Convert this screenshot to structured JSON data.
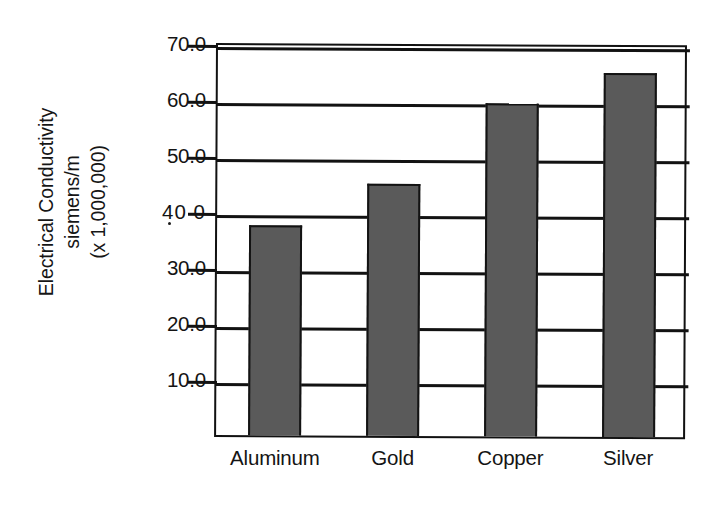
{
  "chart_data": {
    "type": "bar",
    "title": "",
    "subtitle": "",
    "xlabel": "",
    "ylabel": "Electrical Conductivity siemens/m (x 1,000,000)",
    "ylabel_lines": [
      "Electrical Conductivity",
      "siemens/m",
      "(x 1,000,000)"
    ],
    "categories": [
      "Aluminum",
      "Gold",
      "Copper",
      "Silver"
    ],
    "values": [
      37.5,
      45.0,
      59.5,
      65.0
    ],
    "ylim": [
      0,
      70
    ],
    "ytick_values": [
      10.0,
      20.0,
      30.0,
      40.0,
      50.0,
      60.0,
      70.0
    ],
    "ytick_labels": [
      "10.0",
      "20.0",
      "30.0",
      "40 0",
      "50.0",
      "60.0",
      "70.0"
    ],
    "grid": "horizontal",
    "legend": "none",
    "bar_color": "#5a5a5a",
    "bar_edge_color": "#131313",
    "axis_color": "#111111",
    "background_color": "#ffffff"
  },
  "axes": {
    "y_title_line_1": "Electrical Conductivity",
    "y_title_line_2": "siemens/m",
    "y_title_line_3": "(x 1,000,000)"
  },
  "ticks": {
    "y": [
      {
        "label": "70.0",
        "value": 70.0
      },
      {
        "label": "60.0",
        "value": 60.0
      },
      {
        "label": "50.0",
        "value": 50.0
      },
      {
        "label": "40 0",
        "value": 40.0
      },
      {
        "label": "30.0",
        "value": 30.0
      },
      {
        "label": "20.0",
        "value": 20.0
      },
      {
        "label": "10.0",
        "value": 10.0
      }
    ],
    "x": [
      "Aluminum",
      "Gold",
      "Copper",
      "Silver"
    ]
  },
  "bars": [
    {
      "category": "Aluminum",
      "value": 37.5
    },
    {
      "category": "Gold",
      "value": 45.0
    },
    {
      "category": "Copper",
      "value": 59.5
    },
    {
      "category": "Silver",
      "value": 65.0
    }
  ]
}
